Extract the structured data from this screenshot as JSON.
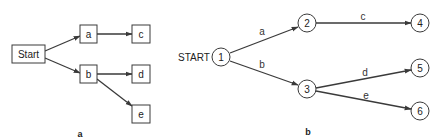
{
  "diagram_a": {
    "caption": "a",
    "nodes": {
      "start": "Start",
      "a": "a",
      "b": "b",
      "c": "c",
      "d": "d",
      "e": "e"
    },
    "edges": [
      {
        "from": "Start",
        "to": "a"
      },
      {
        "from": "Start",
        "to": "b"
      },
      {
        "from": "a",
        "to": "c"
      },
      {
        "from": "b",
        "to": "d"
      },
      {
        "from": "b",
        "to": "e"
      }
    ]
  },
  "diagram_b": {
    "caption": "b",
    "start_label": "START",
    "nodes": {
      "n1": "1",
      "n2": "2",
      "n3": "3",
      "n4": "4",
      "n5": "5",
      "n6": "6"
    },
    "edges": {
      "e12": {
        "from": "1",
        "to": "2",
        "label": "a"
      },
      "e13": {
        "from": "1",
        "to": "3",
        "label": "b"
      },
      "e24": {
        "from": "2",
        "to": "4",
        "label": "c"
      },
      "e35": {
        "from": "3",
        "to": "5",
        "label": "d"
      },
      "e36": {
        "from": "3",
        "to": "6",
        "label": "e"
      }
    }
  },
  "colors": {
    "line": "#3a3a3a",
    "text": "#222222",
    "background": "#ffffff"
  }
}
